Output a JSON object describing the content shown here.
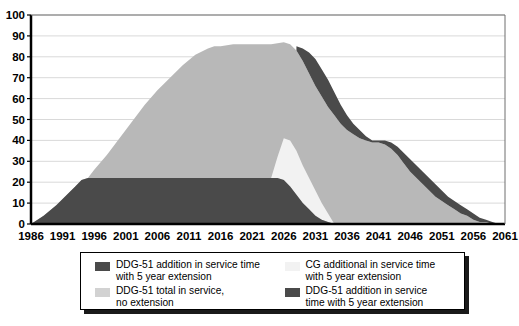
{
  "chart_data": {
    "type": "area",
    "stacked": true,
    "title": "",
    "xlabel": "",
    "ylabel": "",
    "xlim": [
      1986,
      2061
    ],
    "ylim": [
      0,
      100
    ],
    "ytick_step": 10,
    "xtick_step": 5,
    "grid": true,
    "gridlines_horizontal": true,
    "legend_position": "bottom",
    "xticks": [
      "1986",
      "1991",
      "1996",
      "2001",
      "2006",
      "2011",
      "2016",
      "2021",
      "2026",
      "2031",
      "2036",
      "2041",
      "2046",
      "2051",
      "2056",
      "2061"
    ],
    "yticks": [
      "0",
      "10",
      "20",
      "30",
      "40",
      "50",
      "60",
      "70",
      "80",
      "90",
      "100"
    ],
    "colors": {
      "dark_gray": "#4a4a4a",
      "medium_gray": "#b8b8b8",
      "light_gray": "#f2f2f2",
      "axis": "#000000",
      "gridline": "#d9d9d9",
      "background": "#ffffff"
    },
    "series": [
      {
        "name": "DDG-51 total in service, no extension",
        "color": "#b8b8b8",
        "role": "middle-band",
        "x": [
          1986,
          1988,
          1990,
          1991,
          1992,
          1993,
          1994,
          1995,
          1996,
          1998,
          2000,
          2002,
          2004,
          2006,
          2008,
          2010,
          2012,
          2014,
          2015,
          2016,
          2018,
          2020,
          2022,
          2024,
          2026,
          2027,
          2028,
          2029,
          2030,
          2031,
          2032,
          2033,
          2034,
          2035,
          2036,
          2037,
          2038,
          2039,
          2040,
          2041,
          2042,
          2043,
          2044,
          2045,
          2046,
          2047,
          2048,
          2049,
          2050,
          2051,
          2052,
          2053,
          2054,
          2055,
          2056,
          2057,
          2058,
          2059,
          2060,
          2061
        ],
        "y": [
          0,
          4,
          9,
          12,
          15,
          18,
          21,
          22,
          26,
          33,
          41,
          49,
          57,
          64,
          70,
          76,
          81,
          84,
          85,
          85,
          86,
          86,
          86,
          86,
          87,
          86,
          83,
          78,
          72,
          66,
          61,
          56,
          52,
          48,
          45,
          43,
          41,
          40,
          39,
          39,
          38,
          36,
          33,
          29,
          25,
          22,
          19,
          16,
          13,
          11,
          9,
          7,
          5,
          4,
          2,
          1,
          1,
          0,
          0,
          0
        ]
      },
      {
        "name": "DDG-51 addition in service time with 5 year extension",
        "color": "#4a4a4a",
        "role": "bottom-band-and-top-band",
        "bottom_x": [
          1986,
          1988,
          1990,
          1991,
          1992,
          1993,
          1994,
          1995,
          1996,
          2000,
          2010,
          2020,
          2024,
          2025,
          2026,
          2027,
          2028,
          2029,
          2030,
          2031,
          2032,
          2033,
          2034,
          2035,
          2036
        ],
        "bottom_y": [
          0,
          4,
          9,
          12,
          15,
          18,
          21,
          22,
          22,
          22,
          22,
          22,
          22,
          22,
          21,
          18,
          14,
          10,
          7,
          4,
          2,
          1,
          0,
          0,
          0
        ],
        "top_x": [
          2028,
          2029,
          2030,
          2031,
          2032,
          2033,
          2034,
          2035,
          2036,
          2037,
          2038,
          2039,
          2040,
          2041,
          2042,
          2043,
          2044,
          2045,
          2046,
          2047,
          2048,
          2049,
          2050,
          2051,
          2052,
          2053,
          2054,
          2055,
          2056,
          2057,
          2058,
          2059,
          2060,
          2061
        ],
        "top_y": [
          85,
          84,
          82,
          79,
          74,
          69,
          63,
          57,
          52,
          48,
          45,
          42,
          40,
          40,
          40,
          39,
          37,
          34,
          31,
          28,
          25,
          22,
          19,
          16,
          13,
          11,
          9,
          7,
          5,
          3,
          2,
          1,
          0,
          0
        ]
      },
      {
        "name": "CG additional in service time with 5 year extension",
        "color": "#f2f2f2",
        "role": "light-band",
        "x": [
          2024,
          2025,
          2026,
          2027,
          2028,
          2029,
          2030,
          2031,
          2032,
          2033,
          2034
        ],
        "y": [
          0,
          10,
          20,
          22,
          21,
          18,
          15,
          12,
          8,
          4,
          0
        ]
      }
    ]
  },
  "legend": {
    "items": [
      {
        "id": "ddg51-addition-left",
        "label": "DDG-51 addition in service time\nwith 5 year extension",
        "color": "#4a4a4a"
      },
      {
        "id": "ddg51-total-no-extension",
        "label": "DDG-51 total in service,\nno extension",
        "color": "#d2d2d2"
      },
      {
        "id": "cg-additional",
        "label": "CG additional in service time\nwith 5 year extension",
        "color": "#f2f2f2"
      },
      {
        "id": "ddg51-addition-right",
        "label": "DDG-51 addition in service\ntime with 5 year extension",
        "color": "#4a4a4a"
      }
    ]
  }
}
